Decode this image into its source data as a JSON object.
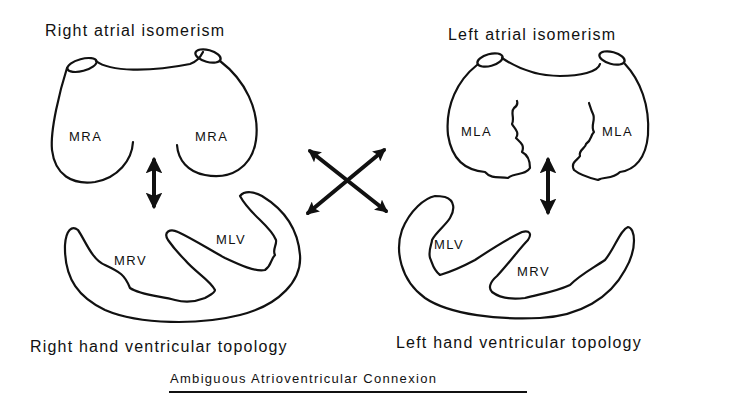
{
  "diagram": {
    "left_panel": {
      "atrial_title": "Right atrial isomerism",
      "atrial_labels": [
        "MRA",
        "MRA"
      ],
      "ventricle_labels": {
        "right": "MRV",
        "left": "MLV"
      },
      "topology_title": "Right hand ventricular topology"
    },
    "right_panel": {
      "atrial_title": "Left atrial isomerism",
      "atrial_labels": [
        "MLA",
        "MLA"
      ],
      "ventricle_labels": {
        "left": "MLV",
        "right": "MRV"
      },
      "topology_title": "Left hand ventricular topology"
    },
    "center": {
      "arrows": "crossed-double-arrows"
    },
    "caption": "Ambiguous Atrioventricular Connexion",
    "colors": {
      "ink": "#111111",
      "background": "#ffffff"
    }
  }
}
